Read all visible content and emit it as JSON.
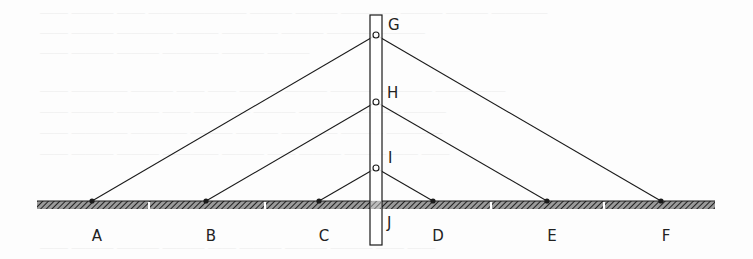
{
  "figure": {
    "type": "cable-stayed bridge schematic",
    "width": 753,
    "height": 259,
    "colors": {
      "line": "#1a1a1a",
      "hatch": "#333333",
      "background": "#fdfdfd"
    },
    "ground": {
      "x1": 37,
      "x2": 715,
      "y_top": 201,
      "y_bottom": 209,
      "gaps_x": [
        149,
        265,
        491,
        604
      ]
    },
    "tower": {
      "x": 370,
      "y": 15,
      "width": 12,
      "height": 230
    },
    "nodes": {
      "G": {
        "x": 376,
        "y": 35
      },
      "H": {
        "x": 376,
        "y": 102
      },
      "I": {
        "x": 376,
        "y": 168
      },
      "A": {
        "x": 92,
        "y": 201
      },
      "B": {
        "x": 206,
        "y": 201
      },
      "C": {
        "x": 319,
        "y": 201
      },
      "D": {
        "x": 433,
        "y": 201
      },
      "E": {
        "x": 547,
        "y": 201
      },
      "F": {
        "x": 661,
        "y": 201
      }
    },
    "cables": [
      [
        "G",
        "A"
      ],
      [
        "G",
        "F"
      ],
      [
        "H",
        "B"
      ],
      [
        "H",
        "E"
      ],
      [
        "I",
        "C"
      ],
      [
        "I",
        "D"
      ]
    ],
    "labels": {
      "A": "A",
      "B": "B",
      "C": "C",
      "D": "D",
      "E": "E",
      "F": "F",
      "G": "G",
      "H": "H",
      "I": "I",
      "J": "J"
    }
  }
}
